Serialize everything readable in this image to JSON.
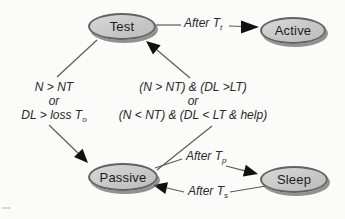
{
  "diagram": {
    "nodes": [
      {
        "id": "test",
        "label": "Test"
      },
      {
        "id": "active",
        "label": "Active"
      },
      {
        "id": "passive",
        "label": "Passive"
      },
      {
        "id": "sleep",
        "label": "Sleep"
      }
    ],
    "edges": {
      "test_active": {
        "label": "After T",
        "sub": "t"
      },
      "test_passive": {
        "line1": "N > NT",
        "line2": "or",
        "line3": "DL > loss T",
        "line3_sub": "o"
      },
      "passive_test": {
        "line1": "(N > NT) & (DL >LT)",
        "line2": "or",
        "line3": "(N < NT) & (DL < LT & help)"
      },
      "passive_sleep": {
        "label": "After T",
        "sub": "p"
      },
      "sleep_passive": {
        "label": "After T",
        "sub": "s"
      }
    },
    "colors": {
      "node_fill": "#c9c9c9",
      "node_border": "#636363",
      "node_shadow": "#6e6e6e",
      "line": "#5b5b5b",
      "arrowhead": "#111111",
      "background": "#fbfbf9"
    }
  }
}
